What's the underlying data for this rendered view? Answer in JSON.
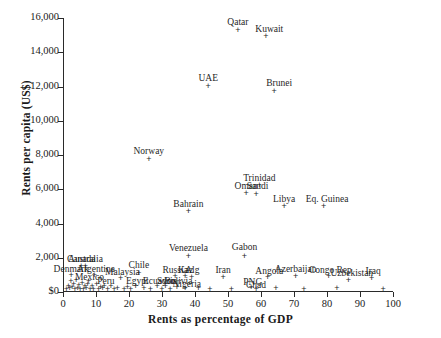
{
  "chart_data": {
    "type": "scatter",
    "title": "",
    "xlabel": "Rents as percentage of GDP",
    "ylabel": "Rents per capita (US$)",
    "xlim": [
      0,
      100
    ],
    "ylim": [
      0,
      16000
    ],
    "xticks": [
      0,
      10,
      20,
      30,
      40,
      50,
      60,
      70,
      80,
      90,
      100
    ],
    "xtick_labels": [
      "0",
      "10",
      "20",
      "30",
      "40",
      "50",
      "60",
      "70",
      "80",
      "90",
      "100"
    ],
    "yticks": [
      0,
      2000,
      4000,
      6000,
      8000,
      10000,
      12000,
      14000,
      16000
    ],
    "ytick_labels": [
      "$0",
      "2,000",
      "4,000",
      "6,000",
      "8,000",
      "10,000",
      "12,000",
      "14,000",
      "16,000"
    ],
    "grid": false,
    "legend": "none",
    "marker": "plus",
    "marker_color": "#262626",
    "points": [
      {
        "label": "Qatar",
        "x": 53.0,
        "y": 15250,
        "lx": 53.0,
        "ly": 15700
      },
      {
        "label": "Kuwait",
        "x": 61.5,
        "y": 14900,
        "lx": 62.5,
        "ly": 15300
      },
      {
        "label": "UAE",
        "x": 44.0,
        "y": 12000,
        "lx": 44.0,
        "ly": 12450
      },
      {
        "label": "Brunei",
        "x": 64.0,
        "y": 11700,
        "lx": 65.5,
        "ly": 12150
      },
      {
        "label": "Norway",
        "x": 26.0,
        "y": 7750,
        "lx": 26.0,
        "ly": 8150
      },
      {
        "label": "Trinidad",
        "x": 59.5,
        "y": 6200,
        "lx": 59.5,
        "ly": 6600
      },
      {
        "label": "Oman",
        "x": 55.5,
        "y": 5750,
        "lx": 55.5,
        "ly": 6150
      },
      {
        "label": "Saudi",
        "x": 58.5,
        "y": 5700,
        "lx": 59.0,
        "ly": 6120
      },
      {
        "label": "Bahrain",
        "x": 38.0,
        "y": 4700,
        "lx": 38.0,
        "ly": 5100
      },
      {
        "label": "Libya",
        "x": 67.0,
        "y": 5000,
        "lx": 67.0,
        "ly": 5350
      },
      {
        "label": "Eq. Guinea",
        "x": 79.0,
        "y": 5000,
        "lx": 80.0,
        "ly": 5400
      },
      {
        "label": "Venezuela",
        "x": 38.0,
        "y": 2100,
        "lx": 38.0,
        "ly": 2500
      },
      {
        "label": "Gabon",
        "x": 55.0,
        "y": 2100,
        "lx": 55.0,
        "ly": 2560
      },
      {
        "label": "Chile",
        "x": 23.0,
        "y": 1100,
        "lx": 23.0,
        "ly": 1500
      },
      {
        "label": "Canada",
        "x": 5.5,
        "y": 1500,
        "lx": 5.5,
        "ly": 1880
      },
      {
        "label": "Australia",
        "x": 6.8,
        "y": 1480,
        "lx": 6.8,
        "ly": 1850
      },
      {
        "label": "Denmark",
        "x": 2.5,
        "y": 950,
        "lx": 2.5,
        "ly": 1290
      },
      {
        "label": "Argentina",
        "x": 9.5,
        "y": 950,
        "lx": 10.0,
        "ly": 1290
      },
      {
        "label": "Malaysia",
        "x": 17.5,
        "y": 800,
        "lx": 18.0,
        "ly": 1130
      },
      {
        "label": "Russia",
        "x": 34.0,
        "y": 900,
        "lx": 34.0,
        "ly": 1250
      },
      {
        "label": "Kaz",
        "x": 37.0,
        "y": 880,
        "lx": 37.2,
        "ly": 1240
      },
      {
        "label": "Alg",
        "x": 39.0,
        "y": 870,
        "lx": 39.2,
        "ly": 1235
      },
      {
        "label": "Iran",
        "x": 48.5,
        "y": 870,
        "lx": 48.5,
        "ly": 1230
      },
      {
        "label": "Angola",
        "x": 62.0,
        "y": 820,
        "lx": 62.5,
        "ly": 1160
      },
      {
        "label": "Azerbaijan",
        "x": 70.5,
        "y": 900,
        "lx": 70.5,
        "ly": 1270
      },
      {
        "label": "Congo Rep",
        "x": 80.5,
        "y": 880,
        "lx": 81.0,
        "ly": 1250
      },
      {
        "label": "Uzbekistan",
        "x": 86.5,
        "y": 700,
        "lx": 87.5,
        "ly": 1050
      },
      {
        "label": "Iraq",
        "x": 93.5,
        "y": 800,
        "lx": 94.0,
        "ly": 1160
      },
      {
        "label": "Mexico",
        "x": 7.5,
        "y": 450,
        "lx": 8.0,
        "ly": 790
      },
      {
        "label": "Peru",
        "x": 12.5,
        "y": 300,
        "lx": 13.0,
        "ly": 590
      },
      {
        "label": "Egypt",
        "x": 22.0,
        "y": 300,
        "lx": 22.5,
        "ly": 600
      },
      {
        "label": "Ecuador",
        "x": 28.5,
        "y": 300,
        "lx": 29.0,
        "ly": 610
      },
      {
        "label": "Syria",
        "x": 31.0,
        "y": 300,
        "lx": 31.5,
        "ly": 590
      },
      {
        "label": "Bolivia",
        "x": 34.5,
        "y": 280,
        "lx": 35.0,
        "ly": 580
      },
      {
        "label": "Nigeria",
        "x": 37.0,
        "y": 180,
        "lx": 37.5,
        "ly": 380
      },
      {
        "label": "PNG",
        "x": 57.0,
        "y": 250,
        "lx": 57.5,
        "ly": 500
      },
      {
        "label": "Chad",
        "x": 58.5,
        "y": 160,
        "lx": 58.5,
        "ly": 370
      },
      {
        "label": "",
        "x": 1.0,
        "y": 120,
        "lx": 0,
        "ly": 0
      },
      {
        "label": "",
        "x": 1.6,
        "y": 300,
        "lx": 0,
        "ly": 0
      },
      {
        "label": "",
        "x": 2.0,
        "y": 180,
        "lx": 0,
        "ly": 0
      },
      {
        "label": "",
        "x": 2.4,
        "y": 600,
        "lx": 0,
        "ly": 0
      },
      {
        "label": "",
        "x": 2.8,
        "y": 250,
        "lx": 0,
        "ly": 0
      },
      {
        "label": "",
        "x": 3.2,
        "y": 420,
        "lx": 0,
        "ly": 0
      },
      {
        "label": "",
        "x": 3.6,
        "y": 150,
        "lx": 0,
        "ly": 0
      },
      {
        "label": "",
        "x": 4.0,
        "y": 700,
        "lx": 0,
        "ly": 0
      },
      {
        "label": "",
        "x": 4.4,
        "y": 200,
        "lx": 0,
        "ly": 0
      },
      {
        "label": "",
        "x": 4.8,
        "y": 380,
        "lx": 0,
        "ly": 0
      },
      {
        "label": "",
        "x": 5.2,
        "y": 140,
        "lx": 0,
        "ly": 0
      },
      {
        "label": "",
        "x": 5.8,
        "y": 520,
        "lx": 0,
        "ly": 0
      },
      {
        "label": "",
        "x": 6.2,
        "y": 160,
        "lx": 0,
        "ly": 0
      },
      {
        "label": "",
        "x": 6.6,
        "y": 330,
        "lx": 0,
        "ly": 0
      },
      {
        "label": "",
        "x": 7.0,
        "y": 190,
        "lx": 0,
        "ly": 0
      },
      {
        "label": "",
        "x": 7.8,
        "y": 620,
        "lx": 0,
        "ly": 0
      },
      {
        "label": "",
        "x": 8.2,
        "y": 140,
        "lx": 0,
        "ly": 0
      },
      {
        "label": "",
        "x": 8.8,
        "y": 300,
        "lx": 0,
        "ly": 0
      },
      {
        "label": "",
        "x": 9.2,
        "y": 170,
        "lx": 0,
        "ly": 0
      },
      {
        "label": "",
        "x": 10.2,
        "y": 430,
        "lx": 0,
        "ly": 0
      },
      {
        "label": "",
        "x": 10.8,
        "y": 150,
        "lx": 0,
        "ly": 0
      },
      {
        "label": "",
        "x": 11.4,
        "y": 260,
        "lx": 0,
        "ly": 0
      },
      {
        "label": "",
        "x": 12.0,
        "y": 180,
        "lx": 0,
        "ly": 0
      },
      {
        "label": "",
        "x": 13.5,
        "y": 140,
        "lx": 0,
        "ly": 0
      },
      {
        "label": "",
        "x": 14.5,
        "y": 320,
        "lx": 0,
        "ly": 0
      },
      {
        "label": "",
        "x": 15.5,
        "y": 160,
        "lx": 0,
        "ly": 0
      },
      {
        "label": "",
        "x": 16.5,
        "y": 230,
        "lx": 0,
        "ly": 0
      },
      {
        "label": "",
        "x": 18.5,
        "y": 150,
        "lx": 0,
        "ly": 0
      },
      {
        "label": "",
        "x": 19.5,
        "y": 260,
        "lx": 0,
        "ly": 0
      },
      {
        "label": "",
        "x": 20.5,
        "y": 140,
        "lx": 0,
        "ly": 0
      },
      {
        "label": "",
        "x": 24.5,
        "y": 200,
        "lx": 0,
        "ly": 0
      },
      {
        "label": "",
        "x": 26.5,
        "y": 140,
        "lx": 0,
        "ly": 0
      },
      {
        "label": "",
        "x": 30.0,
        "y": 170,
        "lx": 0,
        "ly": 0
      },
      {
        "label": "",
        "x": 32.5,
        "y": 150,
        "lx": 0,
        "ly": 0
      },
      {
        "label": "",
        "x": 41.0,
        "y": 180,
        "lx": 0,
        "ly": 0
      },
      {
        "label": "",
        "x": 44.5,
        "y": 140,
        "lx": 0,
        "ly": 0
      },
      {
        "label": "",
        "x": 51.0,
        "y": 160,
        "lx": 0,
        "ly": 0
      },
      {
        "label": "",
        "x": 64.5,
        "y": 200,
        "lx": 0,
        "ly": 0
      },
      {
        "label": "",
        "x": 73.0,
        "y": 170,
        "lx": 0,
        "ly": 0
      },
      {
        "label": "",
        "x": 83.0,
        "y": 190,
        "lx": 0,
        "ly": 0
      },
      {
        "label": "",
        "x": 97.0,
        "y": 150,
        "lx": 0,
        "ly": 0
      }
    ]
  }
}
